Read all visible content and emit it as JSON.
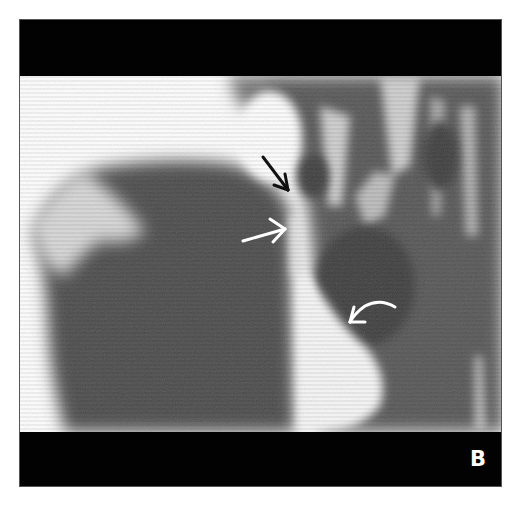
{
  "figure": {
    "panel_label": "B",
    "colors": {
      "background": "#ffffff",
      "band": "#020202",
      "tissue_dark": "#4e4e4e",
      "tissue_mid": "#6a6a6a",
      "bright": "#f4f4f4"
    },
    "annotations": [
      {
        "name": "black-straight-arrow",
        "color": "#111111",
        "direction": "down-right"
      },
      {
        "name": "white-straight-arrow",
        "color": "#ffffff",
        "direction": "right"
      },
      {
        "name": "white-curved-arrow",
        "color": "#ffffff",
        "direction": "left-down"
      }
    ]
  }
}
